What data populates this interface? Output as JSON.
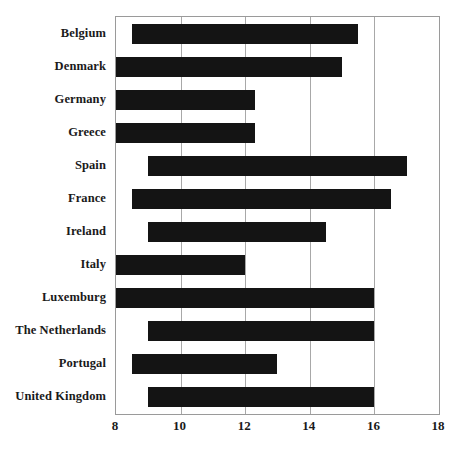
{
  "chart_data": {
    "type": "bar",
    "orientation": "horizontal",
    "subtype": "range-bar",
    "title": "",
    "subtitle": "",
    "xlabel": "",
    "ylabel": "",
    "xlim": [
      8,
      18
    ],
    "ylim": null,
    "grid": true,
    "legend": null,
    "legend_position": "none",
    "bar_color": "#141414",
    "categories": [
      "Belgium",
      "Denmark",
      "Germany",
      "Greece",
      "Spain",
      "France",
      "Ireland",
      "Italy",
      "Luxemburg",
      "The Netherlands",
      "Portugal",
      "United Kingdom"
    ],
    "xticks": [
      8,
      10,
      12,
      14,
      16,
      18
    ],
    "xticklabels": [
      "8",
      "10",
      "12",
      "14",
      "16",
      "18"
    ],
    "bars": [
      {
        "category": "Belgium",
        "start": 8.5,
        "end": 15.5
      },
      {
        "category": "Denmark",
        "start": 8.0,
        "end": 15.0
      },
      {
        "category": "Germany",
        "start": 8.0,
        "end": 12.3
      },
      {
        "category": "Greece",
        "start": 8.0,
        "end": 12.3
      },
      {
        "category": "Spain",
        "start": 9.0,
        "end": 17.0
      },
      {
        "category": "France",
        "start": 8.5,
        "end": 16.5
      },
      {
        "category": "Ireland",
        "start": 9.0,
        "end": 14.5
      },
      {
        "category": "Italy",
        "start": 8.0,
        "end": 12.0
      },
      {
        "category": "Luxemburg",
        "start": 8.0,
        "end": 16.0
      },
      {
        "category": "The Netherlands",
        "start": 9.0,
        "end": 16.0
      },
      {
        "category": "Portugal",
        "start": 8.5,
        "end": 13.0
      },
      {
        "category": "United Kingdom",
        "start": 9.0,
        "end": 16.0
      }
    ],
    "starts": [
      8.5,
      8.0,
      8.0,
      8.0,
      9.0,
      8.5,
      9.0,
      8.0,
      8.0,
      9.0,
      8.5,
      9.0
    ],
    "ends": [
      15.5,
      15.0,
      12.3,
      12.3,
      17.0,
      16.5,
      14.5,
      12.0,
      16.0,
      16.0,
      13.0,
      16.0
    ],
    "values": [
      7.0,
      7.0,
      4.3,
      4.3,
      8.0,
      8.0,
      5.5,
      4.0,
      8.0,
      7.0,
      4.5,
      7.0
    ]
  }
}
